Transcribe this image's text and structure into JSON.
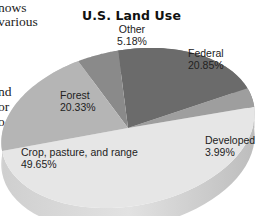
{
  "body_text_fragments": [
    "nows",
    "various",
    "nd",
    "or",
    "o"
  ],
  "chart_data": {
    "type": "pie",
    "title": "U.S. Land Use",
    "style": "3d",
    "slices": [
      {
        "label": "Crop, pasture, and range",
        "value": 49.65,
        "display": "49.65%",
        "color": "#e6e6e6"
      },
      {
        "label": "Forest",
        "value": 20.33,
        "display": "20.33%",
        "color": "#b5b5b5"
      },
      {
        "label": "Other",
        "value": 5.18,
        "display": "5.18%",
        "color": "#8a8a8a"
      },
      {
        "label": "Federal",
        "value": 20.85,
        "display": "20.85%",
        "color": "#6b6b6b"
      },
      {
        "label": "Developed",
        "value": 3.99,
        "display": "3.99%",
        "color": "#9e9e9e"
      }
    ],
    "unit": "%",
    "legend": "none"
  }
}
